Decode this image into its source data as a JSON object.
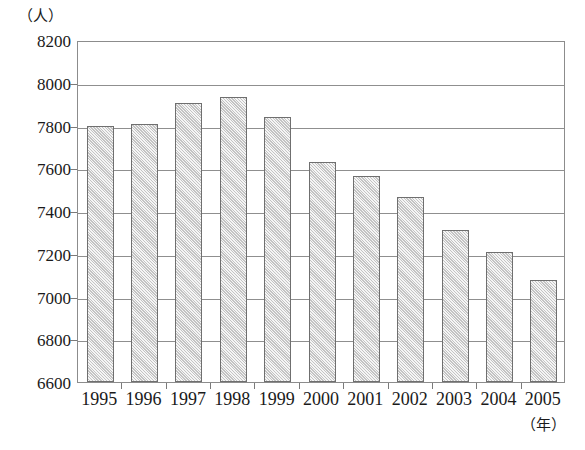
{
  "chart_data": {
    "type": "bar",
    "title": "",
    "subtitle": "",
    "xlabel": "（年）",
    "ylabel": "（人）",
    "categories": [
      "1995",
      "1996",
      "1997",
      "1998",
      "1999",
      "2000",
      "2001",
      "2002",
      "2003",
      "2004",
      "2005"
    ],
    "values": [
      7800,
      7805,
      7905,
      7935,
      7840,
      7630,
      7565,
      7465,
      7310,
      7210,
      7075
    ],
    "series": [
      {
        "name": "人数",
        "values": [
          7800,
          7805,
          7905,
          7935,
          7840,
          7630,
          7565,
          7465,
          7310,
          7210,
          7075
        ]
      }
    ],
    "ylim": [
      6600,
      8200
    ],
    "ytick_labels": [
      "8200",
      "8000",
      "7800",
      "7600",
      "7400",
      "7200",
      "7000",
      "6800",
      "6600"
    ],
    "ytick_values": [
      8200,
      8000,
      7800,
      7600,
      7400,
      7200,
      7000,
      6800,
      6600
    ],
    "ytick_step": 200,
    "grid": true,
    "grid_axis": "y",
    "legend": false,
    "legend_position": "none",
    "bar_fill_color": "#d9d9d9",
    "bar_border_color": "#6f6f6f",
    "axis_color": "#8c8c8c",
    "background_color": "#ffffff"
  },
  "axes": {
    "y_unit": "（人）",
    "x_unit": "（年）"
  },
  "caption": {
    "text": ""
  }
}
